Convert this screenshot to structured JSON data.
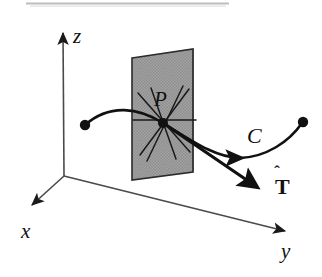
{
  "figure": {
    "background_color": "#ffffff",
    "ink_color": "#111111",
    "plane_fill_color": "#9c9c9c",
    "plane_edge_color": "#2b2b2b",
    "width": 322,
    "height": 277
  },
  "scan_artifact": {
    "name": "top-rule-line",
    "color": "#a8a8a8",
    "x_start": 26,
    "x_end": 229,
    "y": 3,
    "thickness": 2
  },
  "axes": [
    {
      "key": "x",
      "label": "x",
      "direction": "down-left",
      "origin": [
        64,
        176
      ],
      "tip": [
        28,
        208
      ],
      "label_pos": [
        24,
        238
      ]
    },
    {
      "key": "z",
      "label": "z",
      "direction": "up",
      "origin": [
        64,
        176
      ],
      "tip": [
        63,
        29
      ],
      "label_pos": [
        73,
        43
      ]
    },
    {
      "key": "y",
      "label": "y",
      "direction": "right-down",
      "origin": [
        64,
        176
      ],
      "tip": [
        290,
        232
      ],
      "label_pos": [
        283,
        257
      ]
    }
  ],
  "plane": {
    "name": "tangent-plane",
    "corners": [
      [
        132,
        58
      ],
      [
        193,
        49
      ],
      [
        193,
        172
      ],
      [
        132,
        180
      ]
    ],
    "fill": "#9c9c9c",
    "stroke": "#2b2b2b"
  },
  "point": {
    "label": "P",
    "label_pos": [
      160,
      104
    ],
    "center": [
      163,
      123
    ],
    "radius": 4.5,
    "radiating_lines": [
      [
        [
          133,
          120
        ],
        [
          196,
          120
        ]
      ],
      [
        [
          138,
          93
        ],
        [
          190,
          152
        ]
      ],
      [
        [
          140,
          155
        ],
        [
          189,
          89
        ]
      ],
      [
        [
          150,
          88
        ],
        [
          176,
          158
        ]
      ],
      [
        [
          183,
          86
        ],
        [
          147,
          160
        ]
      ]
    ]
  },
  "curve": {
    "label": "C",
    "label_pos": [
      252,
      140
    ],
    "start_dot": [
      85,
      125
    ],
    "end_dot": [
      303,
      122
    ],
    "path": "M 85,125 C 112,104 140,110 163,123 C 196,142 218,158 243,158 C 266,157 288,142 303,122",
    "arrowhead_at": [
      243,
      158
    ],
    "arrowhead_angle_deg": 8
  },
  "tangent_vector": {
    "label": "T",
    "label_accent": "hat",
    "label_pos": [
      281,
      189
    ],
    "accent_pos": [
      287,
      172
    ],
    "from": [
      163,
      123
    ],
    "to": [
      258,
      188
    ],
    "stroke_width": 3
  }
}
